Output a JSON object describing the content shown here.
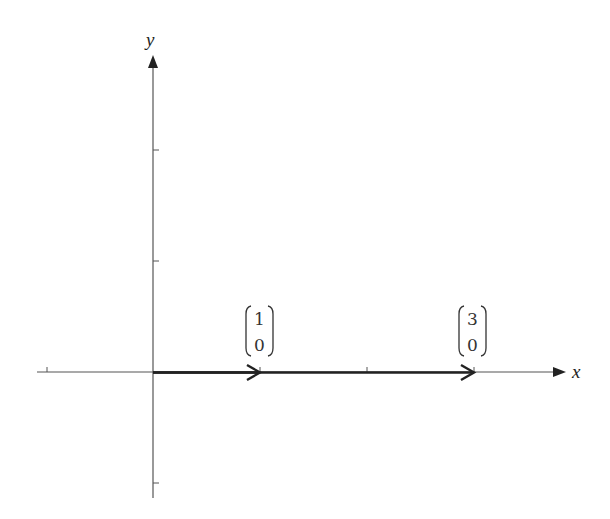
{
  "header": {
    "text": ""
  },
  "diagram": {
    "type": "vector-plot",
    "axes": {
      "x_label": "x",
      "y_label": "y",
      "origin_px": [
        153,
        372
      ],
      "unit_px_x": 107,
      "unit_px_y": 111
    },
    "x_ticks": [
      -1,
      1,
      2,
      3
    ],
    "y_ticks": [
      2,
      1,
      -1
    ],
    "vectors": [
      {
        "name": "vector-1-0",
        "from": [
          0,
          0
        ],
        "to": [
          1,
          0
        ],
        "label_top": "1",
        "label_bottom": "0"
      },
      {
        "name": "vector-3-0",
        "from": [
          0,
          0
        ],
        "to": [
          3,
          0
        ],
        "label_top": "3",
        "label_bottom": "0"
      }
    ],
    "colors": {
      "axis": "#555555",
      "vector": "#222222",
      "text": "#333333"
    }
  }
}
